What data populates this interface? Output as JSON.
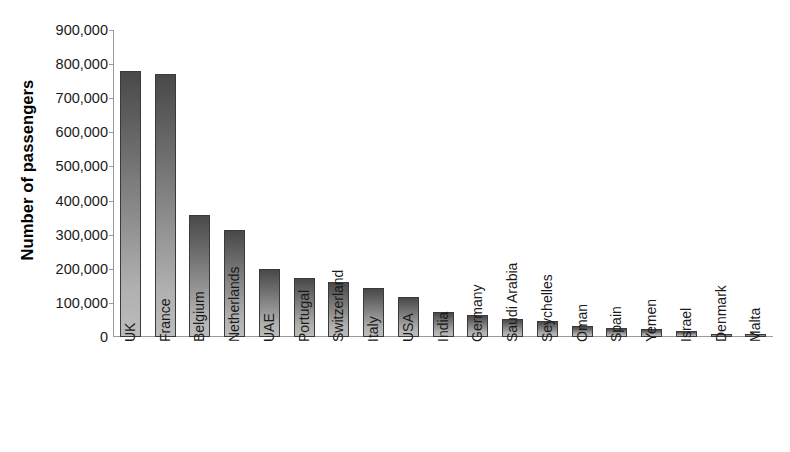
{
  "chart_data": {
    "type": "bar",
    "title": "",
    "subtitle": "",
    "xlabel": "",
    "ylabel": "Number of passengers",
    "ylim": [
      0,
      900000
    ],
    "ytick_step": 100000,
    "ytick_labels": [
      "900,000",
      "800,000",
      "700,000",
      "600,000",
      "500,000",
      "400,000",
      "300,000",
      "200,000",
      "100,000",
      "0"
    ],
    "ytick_values": [
      900000,
      800000,
      700000,
      600000,
      500000,
      400000,
      300000,
      200000,
      100000,
      0
    ],
    "grid": false,
    "legend": null,
    "legend_position": "none",
    "orientation": "vertical",
    "categories": [
      "UK",
      "France",
      "Belgium",
      "Netherlands",
      "UAE",
      "Portugal",
      "Switzerland",
      "Italy",
      "USA",
      "India",
      "Germany",
      "Saudi Arabia",
      "Seychelles",
      "Oman",
      "Spain",
      "Yemen",
      "Israel",
      "Denmark",
      "Malta"
    ],
    "values": [
      780000,
      772000,
      357000,
      313000,
      200000,
      172000,
      160000,
      145000,
      117000,
      73000,
      64000,
      53000,
      48000,
      31000,
      25000,
      24000,
      17000,
      10000,
      9000
    ],
    "bar_color_top": "#494949",
    "bar_color_bottom": "#bcbcbc",
    "bar_border_color": "#3a3a3a",
    "axis_color": "#9a9a9a",
    "text_color": "#1a1a1a"
  }
}
